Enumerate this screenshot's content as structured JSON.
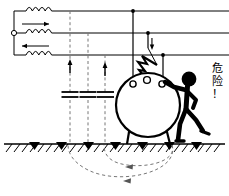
{
  "figure": {
    "warning_label": "危\n险\n！",
    "warning_label_chars": [
      "危",
      "险",
      "！"
    ],
    "stroke_color": "#000000",
    "dashed_color": "#666666",
    "background_color": "#ffffff"
  },
  "source": {
    "terminal_label": "",
    "coil_count": 3,
    "coils": [
      {
        "name": "coil-top",
        "bumps": 4,
        "arrow": "none"
      },
      {
        "name": "coil-middle",
        "bumps": 4,
        "arrow": "right"
      },
      {
        "name": "coil-bottom",
        "bumps": 4,
        "arrow": "left"
      }
    ]
  },
  "lines": {
    "count": 3,
    "phases": [
      {
        "name": "phase-line-1",
        "y": 11
      },
      {
        "name": "phase-line-2",
        "y": 33
      },
      {
        "name": "phase-line-3",
        "y": 55
      }
    ]
  },
  "capacitors": {
    "count": 3,
    "items": [
      {
        "name": "stray-capacitance-1",
        "x": 70,
        "arrow": "up"
      },
      {
        "name": "stray-capacitance-2",
        "x": 88,
        "arrow": "none"
      },
      {
        "name": "stray-capacitance-3",
        "x": 105,
        "arrow": "up"
      }
    ]
  },
  "drops": {
    "count": 3,
    "items": [
      {
        "name": "drop-wire-1",
        "x": 133
      },
      {
        "name": "drop-wire-2",
        "x": 148
      },
      {
        "name": "drop-wire-3",
        "x": 163
      }
    ],
    "fault_current_arrow": "down"
  },
  "transformer": {
    "name": "pole-transformer",
    "bushings": 3,
    "legs": 2
  },
  "arc": {
    "name": "electric-arc",
    "description": "zigzag flashover from drop conductor to transformer bushing"
  },
  "person": {
    "name": "person-touching-transformer",
    "pose": "standing, right arm extended touching transformer tank"
  },
  "ground": {
    "name": "earth-surface",
    "electrode_count": 7,
    "hatching": true
  },
  "return_paths": {
    "count": 2,
    "arrow_direction": "left",
    "items": [
      {
        "name": "earth-return-path-inner"
      },
      {
        "name": "earth-return-path-outer"
      }
    ]
  }
}
